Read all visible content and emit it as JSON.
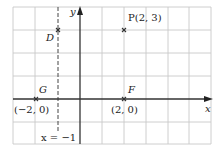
{
  "diagram": {
    "type": "coordinate-plane",
    "grid": {
      "x_lines_px": [
        13,
        35,
        58,
        80,
        102,
        124,
        146,
        168,
        189,
        211
      ],
      "y_lines_px": [
        7,
        30,
        53,
        76,
        99,
        122,
        144
      ],
      "origin_px": [
        80,
        99
      ],
      "unit_x_px": 22,
      "unit_y_px": 23,
      "x_range": [
        -3,
        6
      ],
      "y_range": [
        -2,
        4
      ]
    },
    "colors": {
      "grid": "#c8c8c8",
      "axis": "#333333",
      "point": "#333333",
      "text": "#222222"
    },
    "axes": {
      "x_label": "x",
      "y_label": "y"
    },
    "dashed_line": {
      "equation": "x = −1",
      "label": "x = −1",
      "x_value": -1
    },
    "points": [
      {
        "name": "P",
        "label": "P(2, 3)",
        "x": 2,
        "y": 3
      },
      {
        "name": "D",
        "label": "D",
        "x": -1,
        "y": 3
      },
      {
        "name": "G",
        "label": "G",
        "x": -2,
        "y": 0,
        "coord_label": "(−2, 0)"
      },
      {
        "name": "F",
        "label": "F",
        "x": 2,
        "y": 0,
        "coord_label": "(2, 0)"
      }
    ]
  }
}
